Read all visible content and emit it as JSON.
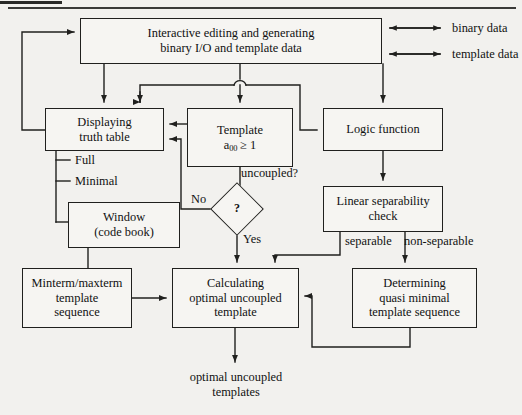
{
  "diagram": {
    "type": "flowchart",
    "background_color": "#f2f1ee",
    "line_color": "#20201e",
    "nodes": [
      {
        "id": "interactive",
        "label": "Interactive editing and generating\nbinary I/O and template data",
        "line1": "Interactive editing and generating",
        "line2": "binary I/O and template data",
        "shape": "rect",
        "x": 80,
        "y": 18,
        "w": 302,
        "h": 46
      },
      {
        "id": "displaying",
        "line1": "Displaying",
        "line2": "truth table",
        "shape": "rect",
        "x": 45,
        "y": 108,
        "w": 119,
        "h": 43
      },
      {
        "id": "template",
        "line1": "Template",
        "line2": "a00 ≥ 1",
        "shape": "rect",
        "x": 187,
        "y": 108,
        "w": 106,
        "h": 59
      },
      {
        "id": "logic",
        "line1": "Logic function",
        "line2": "",
        "shape": "rect",
        "x": 323,
        "y": 108,
        "w": 120,
        "h": 43
      },
      {
        "id": "window",
        "line1": "Window",
        "line2": "(code book)",
        "shape": "rect",
        "x": 68,
        "y": 202,
        "w": 112,
        "h": 46
      },
      {
        "id": "linsep",
        "line1": "Linear separability",
        "line2": "check",
        "shape": "rect",
        "x": 323,
        "y": 186,
        "w": 120,
        "h": 46
      },
      {
        "id": "minterm",
        "line1": "Minterm/maxterm",
        "line2": "template",
        "line3": "sequence",
        "shape": "rect",
        "x": 22,
        "y": 268,
        "w": 110,
        "h": 60
      },
      {
        "id": "calculating",
        "line1": "Calculating",
        "line2": "optimal uncoupled",
        "line3": "template",
        "shape": "rect",
        "x": 172,
        "y": 268,
        "w": 127,
        "h": 60
      },
      {
        "id": "determining",
        "line1": "Determining",
        "line2": "quasi minimal",
        "line3": "template sequence",
        "shape": "rect",
        "x": 352,
        "y": 268,
        "w": 125,
        "h": 60
      },
      {
        "id": "decision",
        "line1": "?",
        "shape": "diamond",
        "x": 218,
        "y": 190,
        "w": 38,
        "h": 38
      }
    ],
    "edge_labels": [
      {
        "id": "binary-data",
        "text": "binary data",
        "x": 452,
        "y": 23
      },
      {
        "id": "template-data",
        "text": "template data",
        "x": 452,
        "y": 49
      },
      {
        "id": "full",
        "text": "Full",
        "x": 75,
        "y": 160
      },
      {
        "id": "minimal",
        "text": "Minimal",
        "x": 75,
        "y": 181
      },
      {
        "id": "no",
        "text": "No",
        "x": 193,
        "y": 190
      },
      {
        "id": "yes",
        "text": "Yes",
        "x": 243,
        "y": 237
      },
      {
        "id": "uncoupled",
        "text": "uncoupled?",
        "x": 243,
        "y": 172
      },
      {
        "id": "separable",
        "text": "separable",
        "x": 345,
        "y": 239
      },
      {
        "id": "non-separable",
        "text": "non-separable",
        "x": 403,
        "y": 239
      },
      {
        "id": "output",
        "text": "optimal uncoupled\ntemplates",
        "line1": "optimal uncoupled",
        "line2": "templates",
        "x": 190,
        "y": 379
      }
    ]
  }
}
